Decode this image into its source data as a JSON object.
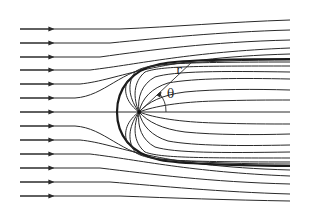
{
  "diagram": {
    "labels": {
      "radius": "r",
      "angle": "θ"
    },
    "colors": {
      "stroke": "#2a2a2a",
      "background": "#ffffff"
    },
    "source_point": {
      "x": 139,
      "y": 112
    },
    "dividing_streamline_nose_x": 117,
    "incoming_streamline_count": 13
  }
}
